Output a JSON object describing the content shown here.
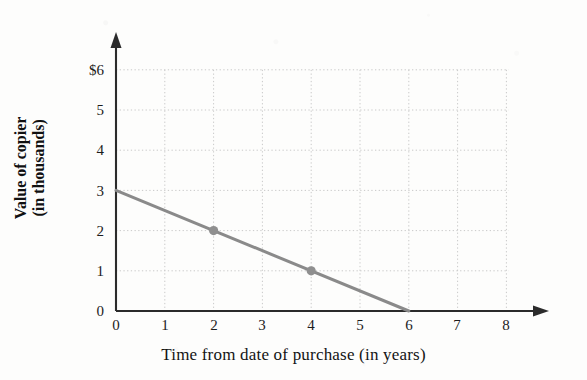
{
  "chart_data": {
    "type": "line",
    "title": "",
    "subtitle": "",
    "xlabel": "Time from date of purchase (in years)",
    "ylabel": "Value of copier (in thousands)",
    "ylabel_line1": "Value of copier",
    "ylabel_line2": "(in thousands)",
    "xlim": [
      0,
      8
    ],
    "ylim": [
      0,
      6
    ],
    "xticks": [
      0,
      1,
      2,
      3,
      4,
      5,
      6,
      7,
      8
    ],
    "xtick_labels": [
      "0",
      "1",
      "2",
      "3",
      "4",
      "5",
      "6",
      "7",
      "8"
    ],
    "yticks": [
      0,
      1,
      2,
      3,
      4,
      5,
      6
    ],
    "ytick_labels": [
      "0",
      "1",
      "2",
      "3",
      "4",
      "5",
      "$6"
    ],
    "grid": true,
    "grid_style": "dotted",
    "legend": "none",
    "series": [
      {
        "name": "Value of copier",
        "x": [
          0,
          6
        ],
        "y": [
          3,
          0
        ],
        "equation": "y = 3 - 0.5x",
        "slope": -0.5,
        "intercept": 3,
        "x_intercept": 6,
        "color": "#8a8a8a",
        "line_width": 3,
        "markers": [
          {
            "x": 2,
            "y": 2
          },
          {
            "x": 4,
            "y": 1
          }
        ],
        "marker_color": "#8f8f8f"
      }
    ],
    "annotations": [],
    "axis_arrows": {
      "x": true,
      "y": true
    },
    "currency_symbol": "$",
    "units": "thousands of dollars"
  },
  "colors": {
    "background": "#fdfdfc",
    "axis": "#2b2b2b",
    "grid": "#c9c9c9",
    "line": "#8a8a8a",
    "marker": "#8f8f8f",
    "text": "#1a1a1a"
  },
  "geometry": {
    "origin_x": 116,
    "origin_y": 311,
    "x_step": 48.8,
    "y_step": 40.2
  }
}
